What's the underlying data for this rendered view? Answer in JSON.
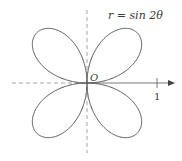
{
  "diagram": {
    "type": "polar-rose",
    "equation_label": "r = sin 2θ",
    "origin_label": "O",
    "tick_label": "1",
    "petals": 4,
    "colors": {
      "curve": "#555555",
      "axis": "#555555",
      "dashed_axis": "#9a9a9a",
      "text": "#3a3a3a",
      "background": "#ffffff"
    },
    "axes": {
      "horizontal": {
        "negative_style": "dashed",
        "positive_style": "solid-with-arrow",
        "tick_at": 1
      },
      "vertical": {
        "style": "dashed"
      }
    }
  }
}
